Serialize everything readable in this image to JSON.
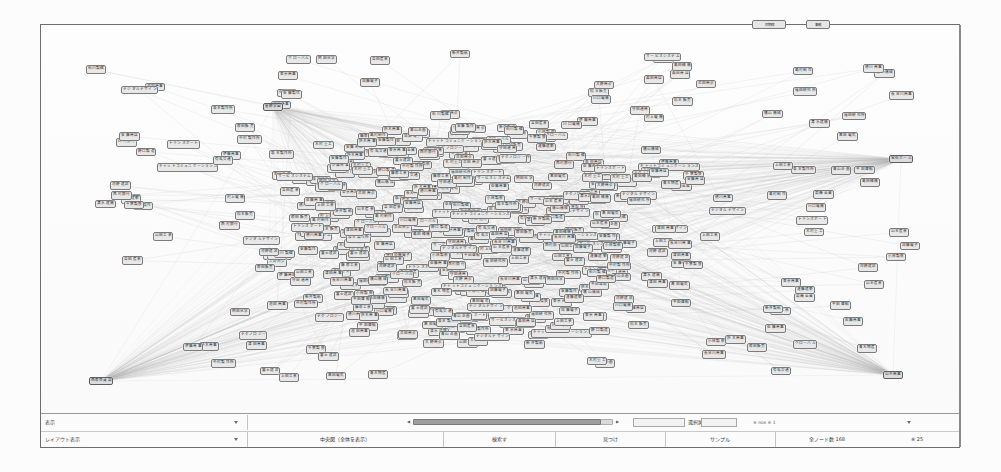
{
  "app": {
    "title": "ネットワーク図",
    "node_border_color": "#7b7b7b",
    "node_fill_color": "#e8e8e8",
    "edge_color": "#b9b9b9",
    "window_border_color": "#6e6e6e"
  },
  "graph": {
    "type": "node-link-network",
    "node_count_visible": 540,
    "hub_nodes": [
      {
        "id": "hub-left-bottom",
        "label": "西原百貨店",
        "x": 60,
        "y": 356
      },
      {
        "id": "hub-right-top",
        "label": "宝石ホール",
        "x": 860,
        "y": 134
      },
      {
        "id": "hub-right-bottom",
        "label": "山中商事",
        "x": 852,
        "y": 350
      },
      {
        "id": "hub-left-top",
        "label": "星野学園",
        "x": 232,
        "y": 82
      }
    ],
    "peripheral_labels": [
      "青木物産",
      "富士建設",
      "山田工業",
      "中村製作所",
      "東京商事",
      "福田研究所",
      "高橋金属",
      "石川製糖",
      "川口電機",
      "松本販売",
      "森田商店",
      "清水建機",
      "島田精機",
      "青山企画",
      "吉田産業",
      "佐藤商事",
      "小林製薬",
      "加藤電子",
      "木村重工",
      "伊藤商事",
      "安藤製作",
      "鈴木商事",
      "上田工業",
      "島村制作",
      "原田販売",
      "西村銀行",
      "大野商会",
      "有馬交通",
      "千葉製鉄",
      "岡田化学",
      "新井製紙",
      "平田運輸",
      "長谷川商事",
      "河野建設",
      "黒田電気",
      "横山機械",
      "山本産業",
      "池田商事",
      "坂本製作所",
      "遠藤建築",
      "守田通商",
      "徳川商事",
      "藤原工業",
      "浜田商会",
      "村上電機",
      "安藤商店",
      "野口製造",
      "津田商事",
      "チャットコミュニケーションズ",
      "サービスシステム",
      "デジタルデザイン",
      "テクノロジー",
      "グローバル",
      "トランスポート"
    ],
    "top_chips": [
      {
        "label": "同期線",
        "x": 752,
        "y": 20,
        "w": 34
      },
      {
        "label": "事務",
        "x": 806,
        "y": 20,
        "w": 24
      }
    ]
  },
  "statusbar": {
    "row1": {
      "col1_label": "表示",
      "dropdown1_caret": "chevron-down-icon",
      "col2_label": "",
      "slider_label": "",
      "slider_min": "◀",
      "slider_max": "▶",
      "right_label": "※ nos ※ 1"
    },
    "row2": {
      "col1_label": "レイアウト表示",
      "dropdown2_caret": "chevron-down-icon",
      "col2_label": "中央図（全体を表示）",
      "col3_label": "検索す",
      "col4_label": "見つけ",
      "col5_label": "サンプル",
      "col6_label": "全ノード数 168",
      "col7_label": "※ 25"
    },
    "row1_cells": [
      {
        "label": "クリック",
        "x": 430
      },
      {
        "label": "選択属性",
        "x": 612
      }
    ],
    "slider": {
      "track_x": 372,
      "track_w": 200,
      "thumb_x": 372,
      "thumb_w": 188
    }
  }
}
